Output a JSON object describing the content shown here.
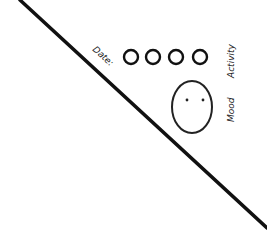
{
  "sketch": {
    "labels": {
      "date": "Date:",
      "activity": "Activity",
      "mood": "Mood"
    },
    "activity_circles": [
      {
        "cx": 131,
        "cy": 57,
        "r": 7
      },
      {
        "cx": 153,
        "cy": 57,
        "r": 7
      },
      {
        "cx": 176,
        "cy": 57,
        "r": 7
      },
      {
        "cx": 200,
        "cy": 57,
        "r": 7
      }
    ],
    "mood_face": {
      "cx": 192,
      "cy": 107,
      "rx": 20,
      "ry": 26,
      "expression": "neutral"
    },
    "diagonal_line": {
      "x1": 20,
      "y1": 0,
      "x2": 267,
      "y2": 228
    },
    "colors": {
      "stroke": "#111111",
      "background": "#ffffff"
    }
  }
}
